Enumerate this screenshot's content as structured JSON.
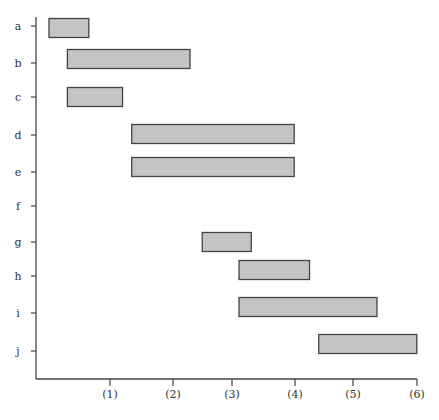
{
  "chart_data": {
    "type": "bar",
    "orientation": "horizontal",
    "subtype": "gantt-interval",
    "title": "",
    "xlabel": "",
    "ylabel": "",
    "categories": [
      "a",
      "b",
      "c",
      "d",
      "e",
      "f",
      "g",
      "h",
      "i",
      "j"
    ],
    "x_ticks": [
      "(1)",
      "(2)",
      "(3)",
      "(4)",
      "(5)",
      "(6)"
    ],
    "x_tick_values": [
      1,
      2,
      3,
      4,
      5,
      6
    ],
    "xlim": [
      -0.2,
      6
    ],
    "grid": false,
    "legend": null,
    "series": [
      {
        "name": "intervals",
        "values": [
          {
            "category": "a",
            "start": 0.0,
            "end": 0.65
          },
          {
            "category": "b",
            "start": 0.3,
            "end": 2.3
          },
          {
            "category": "c",
            "start": 0.3,
            "end": 1.2
          },
          {
            "category": "d",
            "start": 1.35,
            "end": 4.0
          },
          {
            "category": "e",
            "start": 1.35,
            "end": 4.0
          },
          {
            "category": "f",
            "start": null,
            "end": null
          },
          {
            "category": "g",
            "start": 2.5,
            "end": 3.3
          },
          {
            "category": "h",
            "start": 3.1,
            "end": 4.25
          },
          {
            "category": "i",
            "start": 3.1,
            "end": 5.35
          },
          {
            "category": "j",
            "start": 4.4,
            "end": 6.0
          }
        ]
      }
    ]
  },
  "style": {
    "bar_fill": "#c4c4c4",
    "bar_stroke": "#444444",
    "axis_color": "#444444"
  }
}
